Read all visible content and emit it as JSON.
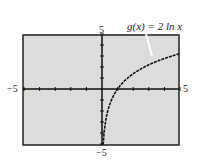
{
  "chart_data": {
    "type": "line",
    "title": "",
    "annotation": "g(x) = 2 ln x",
    "series": [
      {
        "name": "g(x) = 2 ln x",
        "x": [
          0.05,
          0.1,
          0.2,
          0.3,
          0.5,
          0.75,
          1,
          1.5,
          2,
          2.5,
          3,
          3.5,
          4,
          4.5,
          5
        ],
        "values": [
          -5.99,
          -4.61,
          -3.22,
          -2.41,
          -1.39,
          -0.58,
          0,
          0.81,
          1.39,
          1.83,
          2.2,
          2.51,
          2.77,
          3.01,
          3.22
        ]
      }
    ],
    "xlabel": "",
    "ylabel": "",
    "xlim": [
      -5,
      5
    ],
    "ylim": [
      -5,
      5
    ],
    "x_tick_labels": [
      "-5",
      "5"
    ],
    "y_tick_labels": [
      "5",
      "-5"
    ],
    "grid": false,
    "background": "#dcdcdc"
  },
  "labels": {
    "function": "g(x) = 2 ln x",
    "x_min": "−5",
    "x_max": "5",
    "y_max": "5",
    "y_min": "−5"
  }
}
